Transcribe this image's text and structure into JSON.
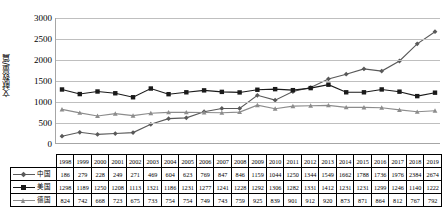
{
  "chart_data": {
    "type": "line",
    "title": "",
    "xlabel": "",
    "ylabel": "文献数量/篇",
    "ylim": [
      0,
      3000
    ],
    "yticks": [
      0,
      500,
      1000,
      1500,
      2000,
      2500,
      3000
    ],
    "ytick_labels": [
      "0",
      "500",
      "1000",
      "1500",
      "2000",
      "2500",
      "3000"
    ],
    "grid": true,
    "legend_position": "table-left",
    "categories": [
      "1998",
      "1999",
      "2000",
      "2001",
      "2002",
      "2003",
      "2004",
      "2005",
      "2006",
      "2007",
      "2008",
      "2009",
      "2010",
      "2011",
      "2012",
      "2013",
      "2014",
      "2015",
      "2016",
      "2017",
      "2018",
      "2019"
    ],
    "series": [
      {
        "name": "中国",
        "color": "#595959",
        "marker": "diamond",
        "values": [
          186,
          279,
          228,
          249,
          271,
          469,
          604,
          623,
          769,
          847,
          846,
          1159,
          1044,
          1250,
          1344,
          1549,
          1662,
          1788,
          1736,
          1976,
          2384,
          2674
        ]
      },
      {
        "name": "美国",
        "color": "#1a1a1a",
        "marker": "square",
        "values": [
          1298,
          1189,
          1250,
          1208,
          1113,
          1321,
          1186,
          1231,
          1277,
          1241,
          1228,
          1292,
          1306,
          1282,
          1331,
          1412,
          1231,
          1231,
          1299,
          1246,
          1140,
          1222
        ]
      },
      {
        "name": "德国",
        "color": "#8c8c8c",
        "marker": "triangle",
        "values": [
          824,
          742,
          668,
          723,
          675,
          733,
          754,
          754,
          749,
          743,
          759,
          925,
          839,
          901,
          912,
          920,
          873,
          871,
          864,
          812,
          767,
          792
        ]
      }
    ]
  },
  "table": {
    "year_header": [
      "1998",
      "1999",
      "2000",
      "2001",
      "2002",
      "2003",
      "2004",
      "2005",
      "2006",
      "2007",
      "2008",
      "2009",
      "2010",
      "2011",
      "2012",
      "2013",
      "2014",
      "2015",
      "2016",
      "2017",
      "2018",
      "2019"
    ],
    "rows": [
      {
        "label": "中国",
        "values": [
          "186",
          "279",
          "228",
          "249",
          "271",
          "469",
          "604",
          "623",
          "769",
          "847",
          "846",
          "1159",
          "1044",
          "1250",
          "1344",
          "1549",
          "1662",
          "1788",
          "1736",
          "1976",
          "2384",
          "2674"
        ]
      },
      {
        "label": "美国",
        "values": [
          "1298",
          "1189",
          "1250",
          "1208",
          "1113",
          "1321",
          "1186",
          "1231",
          "1277",
          "1241",
          "1228",
          "1292",
          "1306",
          "1282",
          "1331",
          "1412",
          "1231",
          "1231",
          "1299",
          "1246",
          "1140",
          "1222"
        ]
      },
      {
        "label": "德国",
        "values": [
          "824",
          "742",
          "668",
          "723",
          "675",
          "733",
          "754",
          "754",
          "749",
          "743",
          "759",
          "925",
          "839",
          "901",
          "912",
          "920",
          "873",
          "871",
          "864",
          "812",
          "767",
          "792"
        ]
      }
    ]
  }
}
